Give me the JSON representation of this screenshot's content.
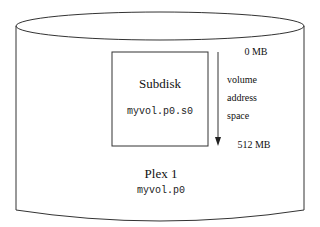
{
  "diagram": {
    "plex": {
      "title": "Plex 1",
      "name": "myvol.p0"
    },
    "subdisk": {
      "title": "Subdisk",
      "name": "myvol.p0.s0"
    },
    "address_space": {
      "start_label": "0 MB",
      "end_label": "512 MB",
      "caption_lines": [
        "volume",
        "address",
        "space"
      ]
    },
    "colors": {
      "stroke": "#333333",
      "background": "#ffffff"
    }
  }
}
